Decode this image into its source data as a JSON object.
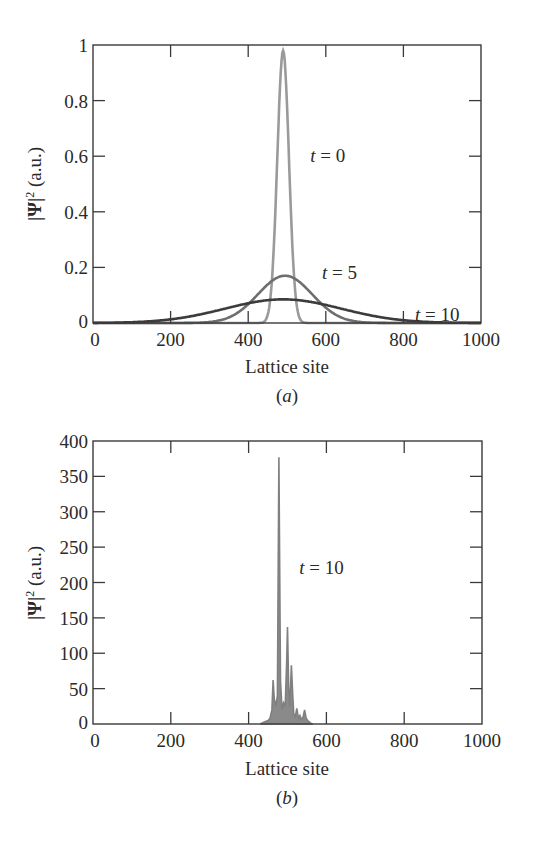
{
  "chart_data": [
    {
      "id": "a",
      "type": "line",
      "caption": "(a)",
      "caption_letter": "a",
      "title": "",
      "xlabel": "Lattice site",
      "ylabel": "|Ψ|² (a.u.)",
      "xlim": [
        0,
        1000
      ],
      "ylim": [
        0,
        1
      ],
      "xticks": [
        0,
        200,
        400,
        600,
        800,
        1000
      ],
      "xtick_labels": [
        "0",
        "200",
        "400",
        "600",
        "800",
        "1000"
      ],
      "yticks": [
        0,
        0.2,
        0.4,
        0.6,
        0.8,
        1
      ],
      "ytick_labels": [
        "0",
        "0.2",
        "0.4",
        "0.6",
        "0.8",
        "1"
      ],
      "grid": false,
      "legend": "none (inline annotations)",
      "series": [
        {
          "name": "t = 0",
          "label_t": "t",
          "label_val": "= 0",
          "color": "#9a9a9a",
          "width": 2.6,
          "center": 490,
          "sigma": 15,
          "peak": 0.98,
          "x": [
            400,
            440,
            460,
            470,
            480,
            490,
            500,
            510,
            520,
            540,
            580
          ],
          "values": [
            0.0,
            0.004,
            0.13,
            0.41,
            0.78,
            0.98,
            0.78,
            0.41,
            0.13,
            0.004,
            0.0
          ]
        },
        {
          "name": "t = 5",
          "label_t": "t",
          "label_val": "= 5",
          "color": "#6e6e6e",
          "width": 2.6,
          "center": 495,
          "sigma": 70,
          "peak": 0.17,
          "x": [
            200,
            300,
            400,
            450,
            495,
            550,
            600,
            700,
            800
          ],
          "values": [
            0.0,
            0.036,
            0.068,
            0.139,
            0.17,
            0.137,
            0.055,
            0.002,
            0.0
          ]
        },
        {
          "name": "t = 10",
          "label_t": "t",
          "label_val": "= 10",
          "color": "#3c3c3c",
          "width": 2.6,
          "center": 490,
          "sigma": 150,
          "peak": 0.085,
          "x": [
            0,
            100,
            200,
            300,
            400,
            490,
            600,
            700,
            800,
            900,
            1000
          ],
          "values": [
            0.001,
            0.003,
            0.013,
            0.038,
            0.071,
            0.085,
            0.065,
            0.032,
            0.01,
            0.002,
            0.0
          ]
        }
      ],
      "annotations": [
        {
          "text": "t = 0",
          "x": 560,
          "y": 0.6
        },
        {
          "text": "t = 5",
          "x": 590,
          "y": 0.18
        },
        {
          "text": "t = 10",
          "x": 830,
          "y": 0.03
        }
      ]
    },
    {
      "id": "b",
      "type": "line",
      "caption": "(b)",
      "caption_letter": "b",
      "title": "",
      "xlabel": "Lattice site",
      "ylabel": "|Ψ|² (a.u.)",
      "xlim": [
        0,
        1000
      ],
      "ylim": [
        0,
        400
      ],
      "xticks": [
        0,
        200,
        400,
        600,
        800,
        1000
      ],
      "xtick_labels": [
        "0",
        "200",
        "400",
        "600",
        "800",
        "1000"
      ],
      "yticks": [
        0,
        50,
        100,
        150,
        200,
        250,
        300,
        350,
        400
      ],
      "ytick_labels": [
        "0",
        "50",
        "100",
        "150",
        "200",
        "250",
        "300",
        "350",
        "400"
      ],
      "grid": false,
      "legend": "none (inline annotation)",
      "series": [
        {
          "name": "t = 10",
          "label_t": "t",
          "label_val": "= 10",
          "color": "#808080",
          "width": 1.6,
          "x": [
            430,
            440,
            450,
            455,
            460,
            463,
            466,
            470,
            474,
            478,
            482,
            486,
            490,
            494,
            498,
            500,
            503,
            506,
            510,
            513,
            516,
            520,
            524,
            528,
            532,
            536,
            540,
            544,
            548,
            552,
            556,
            560,
            565
          ],
          "values": [
            0,
            3,
            5,
            8,
            20,
            62,
            35,
            25,
            40,
            377,
            60,
            20,
            30,
            25,
            90,
            137,
            50,
            25,
            83,
            45,
            15,
            10,
            22,
            8,
            12,
            6,
            10,
            20,
            8,
            5,
            3,
            1,
            0
          ]
        }
      ],
      "annotations": [
        {
          "text": "t = 10",
          "x": 530,
          "y": 220
        }
      ]
    }
  ],
  "figure": {
    "panels": [
      {
        "caption": "(a)"
      },
      {
        "caption": "(b)"
      }
    ]
  }
}
